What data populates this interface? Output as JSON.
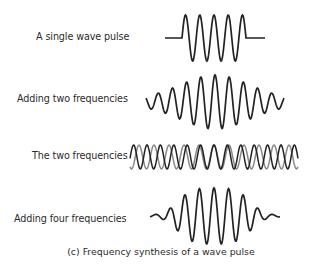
{
  "figure": {
    "caption": "(c) Frequency synthesis of a wave pulse",
    "rows": [
      {
        "label": "A single wave pulse",
        "wave": "single-pulse"
      },
      {
        "label": "Adding two frequencies",
        "wave": "two-frequency-sum"
      },
      {
        "label": "The two frequencies",
        "wave": "two-frequency-overlay"
      },
      {
        "label": "Adding four frequencies",
        "wave": "four-frequency-sum"
      }
    ],
    "colors": {
      "primary_wave": "#222222",
      "secondary_wave": "#8a8a8a",
      "text": "#2b2b2b"
    }
  }
}
